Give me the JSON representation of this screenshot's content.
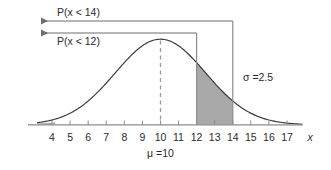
{
  "figure": {
    "title": "",
    "axis_label_x": "x",
    "mean_label": "μ =10",
    "sigma_label": "σ =2.5",
    "prob_upper_label": "P(x < 14)",
    "prob_lower_label": "P(x < 12)",
    "tick_labels": [
      "4",
      "5",
      "6",
      "7",
      "8",
      "9",
      "10",
      "11",
      "12",
      "13",
      "14",
      "15",
      "16",
      "17"
    ],
    "colors": {
      "curve": "#3c3c3c",
      "axis": "#8c8c8c",
      "shaded_region": "#a9a9a9",
      "arrow": "#6e6e6e",
      "dashed_mean": "#9a9a9a",
      "text": "#2b2b2b",
      "background": "#ffffff"
    }
  },
  "chart_data": {
    "type": "area",
    "xlabel": "x",
    "ylabel": "",
    "distribution": "normal",
    "mu": 10,
    "sigma": 2.5,
    "xlim": [
      3.2,
      17.8
    ],
    "ylim": [
      0,
      0.175
    ],
    "grid": false,
    "legend": "none",
    "x_ticks": [
      4,
      5,
      6,
      7,
      8,
      9,
      10,
      11,
      12,
      13,
      14,
      15,
      16,
      17
    ],
    "x_tick_labels": [
      "4",
      "5",
      "6",
      "7",
      "8",
      "9",
      "10",
      "11",
      "12",
      "13",
      "14",
      "15",
      "16",
      "17"
    ],
    "shaded_interval": [
      12,
      14
    ],
    "vertical_lines": [
      {
        "x": 10,
        "style": "dashed",
        "label": "μ =10"
      },
      {
        "x": 12,
        "style": "solid",
        "label": "P(x < 12)"
      },
      {
        "x": 14,
        "style": "solid",
        "label": "P(x < 14)"
      }
    ],
    "annotations": [
      {
        "text": "P(x < 14)",
        "type": "arrow-left",
        "at_x": 14
      },
      {
        "text": "P(x < 12)",
        "type": "arrow-left",
        "at_x": 12
      },
      {
        "text": "σ =2.5",
        "type": "text",
        "near_x": 15.3
      },
      {
        "text": "μ =10",
        "type": "text",
        "near_x": 10
      }
    ],
    "curve_points": {
      "x": [
        3.2,
        4,
        5,
        6,
        7,
        8,
        9,
        10,
        11,
        12,
        13,
        14,
        15,
        16,
        17,
        17.8
      ],
      "y": [
        0.0029,
        0.0072,
        0.0216,
        0.0516,
        0.0966,
        0.1416,
        0.1616,
        0.1596,
        0.1416,
        0.0966,
        0.0516,
        0.0216,
        0.0072,
        0.0019,
        0.0004,
        0.0001
      ]
    }
  }
}
